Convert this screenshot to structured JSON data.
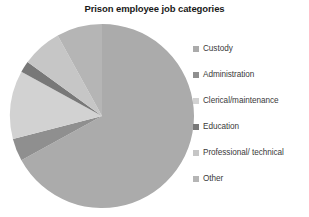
{
  "chart_data": {
    "type": "pie",
    "title": "Prison employee job categories",
    "xlabel": "",
    "ylabel": "",
    "legend_position": "right",
    "grid": false,
    "categories": [
      "Custody",
      "Administration",
      "Clerical/maintenance",
      "Education",
      "Professional/ technical",
      "Other"
    ],
    "values": [
      67,
      4,
      12,
      2,
      7,
      8
    ],
    "colors": [
      "#ababab",
      "#8f8f8f",
      "#d2d2d2",
      "#787878",
      "#c6c6c6",
      "#b5b5b5"
    ],
    "start_angle_deg": 0,
    "direction": "clockwise",
    "units": "percent"
  },
  "chart": {
    "title": "Prison employee job categories",
    "geometry": {
      "center_x": 96,
      "center_y": 96,
      "radius": 92
    }
  },
  "legend": {
    "items": [
      {
        "label": "Custody",
        "color": "#ababab"
      },
      {
        "label": "Administration",
        "color": "#8f8f8f"
      },
      {
        "label": "Clerical/maintenance",
        "color": "#d2d2d2"
      },
      {
        "label": "Education",
        "color": "#787878"
      },
      {
        "label": "Professional/ technical",
        "color": "#c6c6c6"
      },
      {
        "label": "Other",
        "color": "#b5b5b5"
      }
    ]
  }
}
